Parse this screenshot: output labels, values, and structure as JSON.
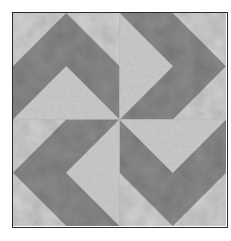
{
  "image": {
    "subject": "quilt-block",
    "pattern": "pinwheel chevrons (four arrows pointing outward rotating clockwise)",
    "colors": {
      "background_light": "#d2d2d2",
      "chevron_dark": "#8a8a8a",
      "script_light": "#c4c4c4",
      "frame": "#2a2a2a",
      "page": "#ffffff"
    }
  }
}
